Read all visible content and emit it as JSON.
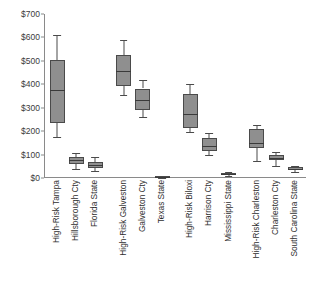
{
  "chart_data": {
    "type": "box",
    "title": "",
    "xlabel": "",
    "ylabel": "",
    "ylim": [
      0,
      700
    ],
    "ytick_labels": [
      "$700",
      "$600",
      "$500",
      "$400",
      "$300",
      "$200",
      "$100",
      "$0"
    ],
    "ytick_values": [
      700,
      600,
      500,
      400,
      300,
      200,
      100,
      0
    ],
    "grid": false,
    "legend": "none",
    "currency_prefix": "$",
    "box_fill_color": "#8f8f8f",
    "box_line_color": "#4a4a4a",
    "axis_color": "#8a8a8a",
    "groups": [
      {
        "name": "Tampa Region",
        "categories": [
          "High-Risk Tampa",
          "Hillsborough Cty",
          "Florida State"
        ]
      },
      {
        "name": "Galveston Region",
        "categories": [
          "High-Risk Galveston",
          "Galveston Cty",
          "Texas State"
        ]
      },
      {
        "name": "Biloxi Region",
        "categories": [
          "High-Risk Biloxi",
          "Harrison Cty",
          "Mississippi State"
        ]
      },
      {
        "name": "Charleston Region",
        "categories": [
          "High-Risk Charleston",
          "Charleston Cty",
          "South Carolina State"
        ]
      }
    ],
    "categories": [
      "High-Risk Tampa",
      "Hillsborough Cty",
      "Florida State",
      "High-Risk Galveston",
      "Galveston Cty",
      "Texas State",
      "High-Risk Biloxi",
      "Harrison Cty",
      "Mississippi State",
      "High-Risk Charleston",
      "Charleston Cty",
      "South Carolina State"
    ],
    "boxes": [
      {
        "label": "High-Risk Tampa",
        "whisker_low": 175,
        "q1": 235,
        "median": 375,
        "q3": 505,
        "whisker_high": 610
      },
      {
        "label": "Hillsborough Cty",
        "whisker_low": 40,
        "q1": 58,
        "median": 75,
        "q3": 88,
        "whisker_high": 108
      },
      {
        "label": "Florida State",
        "whisker_low": 28,
        "q1": 43,
        "median": 55,
        "q3": 70,
        "whisker_high": 88
      },
      {
        "label": "High-Risk Galveston",
        "whisker_low": 355,
        "q1": 392,
        "median": 458,
        "q3": 525,
        "whisker_high": 588
      },
      {
        "label": "Galveston Cty",
        "whisker_low": 262,
        "q1": 290,
        "median": 335,
        "q3": 382,
        "whisker_high": 418
      },
      {
        "label": "Texas State",
        "whisker_low": 2,
        "q1": 4,
        "median": 6,
        "q3": 8,
        "whisker_high": 10
      },
      {
        "label": "High-Risk Biloxi",
        "whisker_low": 198,
        "q1": 212,
        "median": 272,
        "q3": 358,
        "whisker_high": 402
      },
      {
        "label": "Harrison Cty",
        "whisker_low": 100,
        "q1": 115,
        "median": 135,
        "q3": 172,
        "whisker_high": 192
      },
      {
        "label": "Mississippi State",
        "whisker_low": 10,
        "q1": 13,
        "median": 16,
        "q3": 20,
        "whisker_high": 24
      },
      {
        "label": "High-Risk Charleston",
        "whisker_low": 72,
        "q1": 128,
        "median": 148,
        "q3": 208,
        "whisker_high": 228
      },
      {
        "label": "Charleston Cty",
        "whisker_low": 50,
        "q1": 78,
        "median": 86,
        "q3": 100,
        "whisker_high": 110
      },
      {
        "label": "South Carolina State",
        "whisker_low": 26,
        "q1": 33,
        "median": 40,
        "q3": 46,
        "whisker_high": 52
      }
    ]
  }
}
